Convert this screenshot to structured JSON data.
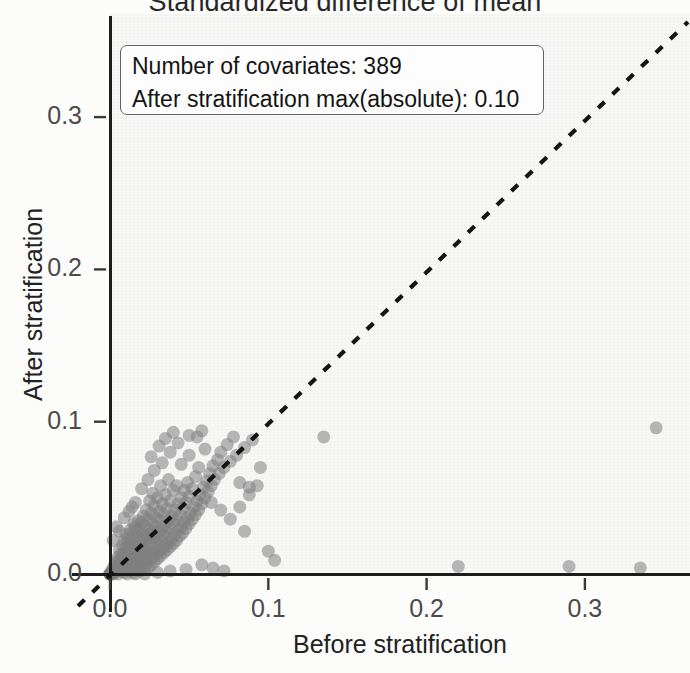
{
  "chart_data": {
    "type": "scatter",
    "title": "Standardized difference of mean",
    "xlabel": "Before stratification",
    "ylabel": "After stratification",
    "xlim": [
      -0.02,
      0.365
    ],
    "ylim": [
      -0.012,
      0.368
    ],
    "xticks": [
      0.0,
      0.1,
      0.2,
      0.3
    ],
    "xticklabels": [
      "0.0",
      "0.1",
      "0.2",
      "0.3"
    ],
    "yticks": [
      0.0,
      0.1,
      0.2,
      0.3
    ],
    "yticklabels": [
      "0.0",
      "0.1",
      "0.2",
      "0.3"
    ],
    "grid": false,
    "legend": "none",
    "reference_line": {
      "type": "identity-diagonal",
      "style": "dashed",
      "color": "#1a1a1a",
      "slope": 1,
      "intercept": 0
    },
    "point_style": {
      "marker": "circle",
      "color": "#808080",
      "opacity": 0.55,
      "size_px": 13
    },
    "series": [
      {
        "name": "covariates",
        "points": [
          [
            0.0,
            0.0
          ],
          [
            0.0,
            0.0
          ],
          [
            0.0,
            0.0
          ],
          [
            0.0,
            0.0
          ],
          [
            0.0,
            0.0
          ],
          [
            0.001,
            0.0
          ],
          [
            0.001,
            0.002
          ],
          [
            0.002,
            0.0
          ],
          [
            0.002,
            0.004
          ],
          [
            0.003,
            0.001
          ],
          [
            0.003,
            0.006
          ],
          [
            0.004,
            0.002
          ],
          [
            0.004,
            0.008
          ],
          [
            0.005,
            0.0
          ],
          [
            0.005,
            0.005
          ],
          [
            0.005,
            0.011
          ],
          [
            0.006,
            0.003
          ],
          [
            0.006,
            0.009
          ],
          [
            0.006,
            0.016
          ],
          [
            0.007,
            0.002
          ],
          [
            0.007,
            0.007
          ],
          [
            0.007,
            0.013
          ],
          [
            0.008,
            0.004
          ],
          [
            0.008,
            0.01
          ],
          [
            0.008,
            0.019
          ],
          [
            0.009,
            0.001
          ],
          [
            0.009,
            0.006
          ],
          [
            0.009,
            0.014
          ],
          [
            0.009,
            0.022
          ],
          [
            0.01,
            0.003
          ],
          [
            0.01,
            0.009
          ],
          [
            0.01,
            0.017
          ],
          [
            0.01,
            0.026
          ],
          [
            0.011,
            0.005
          ],
          [
            0.011,
            0.012
          ],
          [
            0.011,
            0.021
          ],
          [
            0.012,
            0.002
          ],
          [
            0.012,
            0.008
          ],
          [
            0.012,
            0.015
          ],
          [
            0.012,
            0.024
          ],
          [
            0.013,
            0.006
          ],
          [
            0.013,
            0.011
          ],
          [
            0.013,
            0.019
          ],
          [
            0.013,
            0.029
          ],
          [
            0.014,
            0.004
          ],
          [
            0.014,
            0.009
          ],
          [
            0.014,
            0.017
          ],
          [
            0.014,
            0.027
          ],
          [
            0.015,
            0.001
          ],
          [
            0.015,
            0.007
          ],
          [
            0.015,
            0.014
          ],
          [
            0.015,
            0.023
          ],
          [
            0.015,
            0.033
          ],
          [
            0.016,
            0.005
          ],
          [
            0.016,
            0.012
          ],
          [
            0.016,
            0.02
          ],
          [
            0.016,
            0.031
          ],
          [
            0.017,
            0.003
          ],
          [
            0.017,
            0.01
          ],
          [
            0.017,
            0.018
          ],
          [
            0.017,
            0.028
          ],
          [
            0.018,
            0.006
          ],
          [
            0.018,
            0.015
          ],
          [
            0.018,
            0.024
          ],
          [
            0.018,
            0.035
          ],
          [
            0.019,
            0.002
          ],
          [
            0.019,
            0.009
          ],
          [
            0.019,
            0.02
          ],
          [
            0.019,
            0.03
          ],
          [
            0.02,
            0.005
          ],
          [
            0.02,
            0.013
          ],
          [
            0.02,
            0.022
          ],
          [
            0.02,
            0.034
          ],
          [
            0.021,
            0.008
          ],
          [
            0.021,
            0.017
          ],
          [
            0.021,
            0.027
          ],
          [
            0.021,
            0.038
          ],
          [
            0.022,
            0.003
          ],
          [
            0.022,
            0.011
          ],
          [
            0.022,
            0.021
          ],
          [
            0.022,
            0.032
          ],
          [
            0.023,
            0.007
          ],
          [
            0.023,
            0.015
          ],
          [
            0.023,
            0.025
          ],
          [
            0.023,
            0.042
          ],
          [
            0.024,
            0.004
          ],
          [
            0.024,
            0.012
          ],
          [
            0.024,
            0.023
          ],
          [
            0.024,
            0.036
          ],
          [
            0.025,
            0.009
          ],
          [
            0.025,
            0.018
          ],
          [
            0.025,
            0.029
          ],
          [
            0.025,
            0.048
          ],
          [
            0.026,
            0.006
          ],
          [
            0.026,
            0.014
          ],
          [
            0.026,
            0.026
          ],
          [
            0.026,
            0.04
          ],
          [
            0.027,
            0.011
          ],
          [
            0.027,
            0.021
          ],
          [
            0.027,
            0.033
          ],
          [
            0.027,
            0.053
          ],
          [
            0.028,
            0.008
          ],
          [
            0.028,
            0.017
          ],
          [
            0.028,
            0.028
          ],
          [
            0.028,
            0.045
          ],
          [
            0.029,
            0.013
          ],
          [
            0.029,
            0.024
          ],
          [
            0.029,
            0.037
          ],
          [
            0.03,
            0.01
          ],
          [
            0.03,
            0.02
          ],
          [
            0.03,
            0.031
          ],
          [
            0.03,
            0.05
          ],
          [
            0.031,
            0.015
          ],
          [
            0.031,
            0.027
          ],
          [
            0.031,
            0.041
          ],
          [
            0.032,
            0.012
          ],
          [
            0.032,
            0.022
          ],
          [
            0.032,
            0.035
          ],
          [
            0.032,
            0.058
          ],
          [
            0.033,
            0.017
          ],
          [
            0.033,
            0.029
          ],
          [
            0.033,
            0.046
          ],
          [
            0.034,
            0.014
          ],
          [
            0.034,
            0.025
          ],
          [
            0.034,
            0.039
          ],
          [
            0.035,
            0.019
          ],
          [
            0.035,
            0.032
          ],
          [
            0.035,
            0.052
          ],
          [
            0.036,
            0.016
          ],
          [
            0.036,
            0.027
          ],
          [
            0.036,
            0.043
          ],
          [
            0.037,
            0.021
          ],
          [
            0.037,
            0.035
          ],
          [
            0.037,
            0.062
          ],
          [
            0.038,
            0.018
          ],
          [
            0.038,
            0.03
          ],
          [
            0.038,
            0.048
          ],
          [
            0.039,
            0.023
          ],
          [
            0.039,
            0.038
          ],
          [
            0.04,
            0.02
          ],
          [
            0.04,
            0.033
          ],
          [
            0.04,
            0.055
          ],
          [
            0.041,
            0.026
          ],
          [
            0.041,
            0.042
          ],
          [
            0.042,
            0.022
          ],
          [
            0.042,
            0.036
          ],
          [
            0.042,
            0.058
          ],
          [
            0.043,
            0.029
          ],
          [
            0.043,
            0.046
          ],
          [
            0.044,
            0.025
          ],
          [
            0.044,
            0.039
          ],
          [
            0.045,
            0.031
          ],
          [
            0.045,
            0.05
          ],
          [
            0.045,
            0.072
          ],
          [
            0.046,
            0.027
          ],
          [
            0.046,
            0.043
          ],
          [
            0.047,
            0.034
          ],
          [
            0.047,
            0.055
          ],
          [
            0.048,
            0.03
          ],
          [
            0.048,
            0.047
          ],
          [
            0.049,
            0.037
          ],
          [
            0.049,
            0.06
          ],
          [
            0.05,
            0.033
          ],
          [
            0.05,
            0.051
          ],
          [
            0.05,
            0.078
          ],
          [
            0.051,
            0.04
          ],
          [
            0.052,
            0.036
          ],
          [
            0.052,
            0.056
          ],
          [
            0.053,
            0.044
          ],
          [
            0.054,
            0.039
          ],
          [
            0.054,
            0.064
          ],
          [
            0.055,
            0.048
          ],
          [
            0.056,
            0.042
          ],
          [
            0.056,
            0.07
          ],
          [
            0.057,
            0.052
          ],
          [
            0.058,
            0.046
          ],
          [
            0.059,
            0.057
          ],
          [
            0.06,
            0.05
          ],
          [
            0.06,
            0.082
          ],
          [
            0.061,
            0.061
          ],
          [
            0.062,
            0.054
          ],
          [
            0.063,
            0.066
          ],
          [
            0.064,
            0.058
          ],
          [
            0.065,
            0.071
          ],
          [
            0.066,
            0.062
          ],
          [
            0.068,
            0.075
          ],
          [
            0.069,
            0.066
          ],
          [
            0.07,
            0.08
          ],
          [
            0.072,
            0.07
          ],
          [
            0.074,
            0.085
          ],
          [
            0.076,
            0.074
          ],
          [
            0.078,
            0.09
          ],
          [
            0.08,
            0.078
          ],
          [
            0.082,
            0.06
          ],
          [
            0.085,
            0.083
          ],
          [
            0.088,
            0.057
          ],
          [
            0.09,
            0.088
          ],
          [
            0.012,
            0.041
          ],
          [
            0.016,
            0.047
          ],
          [
            0.02,
            0.056
          ],
          [
            0.024,
            0.062
          ],
          [
            0.028,
            0.068
          ],
          [
            0.033,
            0.073
          ],
          [
            0.038,
            0.08
          ],
          [
            0.043,
            0.086
          ],
          [
            0.05,
            0.091
          ],
          [
            0.058,
            0.094
          ],
          [
            0.006,
            0.028
          ],
          [
            0.009,
            0.037
          ],
          [
            0.014,
            0.044
          ],
          [
            0.002,
            0.022
          ],
          [
            0.004,
            0.031
          ],
          [
            0.026,
            0.077
          ],
          [
            0.031,
            0.084
          ],
          [
            0.035,
            0.089
          ],
          [
            0.04,
            0.093
          ],
          [
            0.055,
            0.09
          ],
          [
            0.064,
            0.047
          ],
          [
            0.07,
            0.042
          ],
          [
            0.076,
            0.036
          ],
          [
            0.085,
            0.028
          ],
          [
            0.095,
            0.07
          ],
          [
            0.1,
            0.015
          ],
          [
            0.104,
            0.009
          ],
          [
            0.058,
            0.006
          ],
          [
            0.065,
            0.004
          ],
          [
            0.072,
            0.002
          ],
          [
            0.048,
            0.003
          ],
          [
            0.038,
            0.002
          ],
          [
            0.03,
            0.001
          ],
          [
            0.022,
            0.0
          ],
          [
            0.016,
            0.0
          ],
          [
            0.011,
            0.0
          ],
          [
            0.082,
            0.044
          ],
          [
            0.088,
            0.052
          ],
          [
            0.093,
            0.058
          ],
          [
            0.135,
            0.09
          ],
          [
            0.22,
            0.005
          ],
          [
            0.29,
            0.005
          ],
          [
            0.335,
            0.004
          ],
          [
            0.345,
            0.096
          ]
        ]
      }
    ]
  },
  "annotation": {
    "line1": "Number of covariates: 389",
    "line2": "After stratification max(absolute): 0.10"
  },
  "colors": {
    "point": "#808080",
    "axis": "#1c1c1c",
    "text": "#222222",
    "tick_text": "#4b4b4b",
    "panel_bg": "#f7f7f6",
    "annotation_border": "#5c6470"
  }
}
